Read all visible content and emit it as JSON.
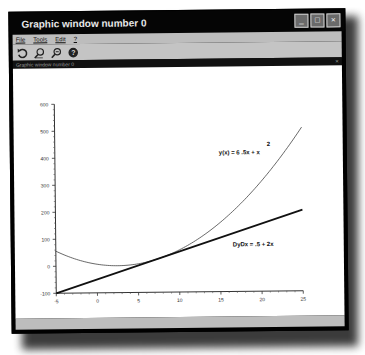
{
  "window": {
    "title": "Graphic window number 0",
    "controls": {
      "minimize": "_",
      "maximize": "□",
      "close": "×"
    }
  },
  "menu": {
    "items": [
      "File",
      "Tools",
      "Edit",
      "?"
    ]
  },
  "toolbar": {
    "icons": [
      "rotate-icon",
      "zoom-in-icon",
      "zoom-out-icon",
      "help-icon"
    ]
  },
  "subwindow": {
    "title": "Graphic window number 0",
    "close": "×"
  },
  "chart_data": {
    "type": "line",
    "title": "",
    "xlabel": "",
    "ylabel": "",
    "xlim": [
      -5,
      25
    ],
    "ylim": [
      -100,
      600
    ],
    "x_ticks": [
      "-5",
      "0",
      "5",
      "10",
      "15",
      "20",
      "25"
    ],
    "y_ticks": [
      "-100",
      "0",
      "100",
      "200",
      "300",
      "400",
      "500",
      "600"
    ],
    "grid": false,
    "series": [
      {
        "name": "y(x) = 6 -5x + x^2",
        "label_main": "y(x) = 6 .5x + x",
        "label_sup": "2",
        "style": "thin",
        "x": [
          -5,
          0,
          2.5,
          5,
          10,
          15,
          20,
          25
        ],
        "values": [
          56,
          6,
          -0.25,
          6,
          56,
          156,
          306,
          506
        ]
      },
      {
        "name": "DyDx = -5 + 2x",
        "label_main": "DyDx = .5 + 2x",
        "style": "thick",
        "x": [
          -5,
          25
        ],
        "values": [
          -100,
          200
        ]
      }
    ]
  }
}
